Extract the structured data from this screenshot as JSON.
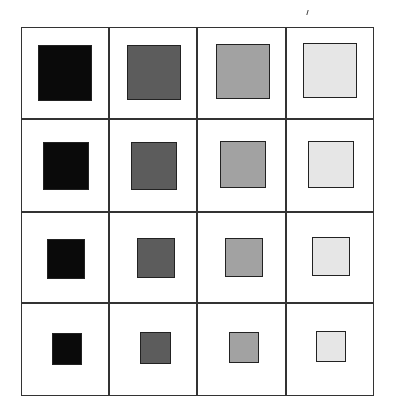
{
  "figure": {
    "columns": [
      {
        "label": "",
        "fill": "#0a0a0a"
      },
      {
        "label": "",
        "fill": "#5c5c5c"
      },
      {
        "label": "",
        "fill": "#a2a2a2"
      },
      {
        "label": "",
        "fill": "#e6e6e6"
      }
    ],
    "rows": [
      {
        "square_size": 54
      },
      {
        "square_size": 46
      },
      {
        "square_size": 38
      },
      {
        "square_size": 31
      }
    ],
    "cells": [
      [
        {
          "x": 38,
          "y": 45,
          "w": 54,
          "h": 56
        },
        {
          "x": 127,
          "y": 45,
          "w": 54,
          "h": 55
        },
        {
          "x": 216,
          "y": 44,
          "w": 54,
          "h": 55
        },
        {
          "x": 303,
          "y": 43,
          "w": 54,
          "h": 55
        }
      ],
      [
        {
          "x": 43,
          "y": 142,
          "w": 46,
          "h": 48
        },
        {
          "x": 131,
          "y": 142,
          "w": 46,
          "h": 48
        },
        {
          "x": 220,
          "y": 141,
          "w": 46,
          "h": 47
        },
        {
          "x": 308,
          "y": 141,
          "w": 46,
          "h": 47
        }
      ],
      [
        {
          "x": 47,
          "y": 239,
          "w": 38,
          "h": 40
        },
        {
          "x": 137,
          "y": 238,
          "w": 38,
          "h": 40
        },
        {
          "x": 225,
          "y": 238,
          "w": 38,
          "h": 39
        },
        {
          "x": 312,
          "y": 237,
          "w": 38,
          "h": 39
        }
      ],
      [
        {
          "x": 52,
          "y": 333,
          "w": 30,
          "h": 32
        },
        {
          "x": 140,
          "y": 332,
          "w": 31,
          "h": 32
        },
        {
          "x": 229,
          "y": 332,
          "w": 30,
          "h": 31
        },
        {
          "x": 316,
          "y": 331,
          "w": 30,
          "h": 31
        }
      ]
    ],
    "grid": {
      "left": 21,
      "top": 27,
      "right": 374,
      "bottom": 396,
      "col_lines": [
        108,
        196,
        285
      ],
      "row_lines": [
        118,
        211,
        302
      ],
      "line_color": "#333333"
    }
  }
}
